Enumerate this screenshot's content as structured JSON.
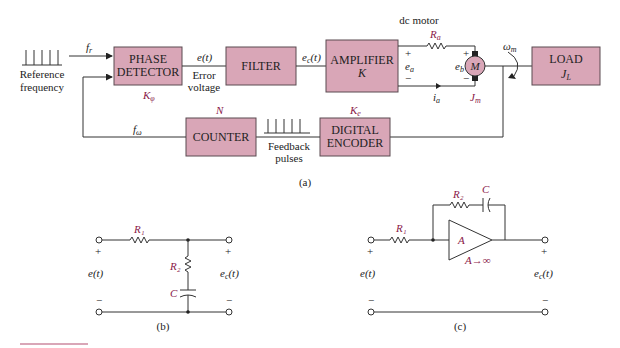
{
  "diagram_a": {
    "caption": "(a)",
    "reference": {
      "label_line1": "Reference",
      "label_line2": "frequency",
      "signal": "f_r"
    },
    "blocks": {
      "phase_detector": {
        "line1": "PHASE",
        "line2": "DETECTOR",
        "gain": "K_φ"
      },
      "filter": {
        "line1": "FILTER"
      },
      "amplifier": {
        "line1": "AMPLIFIER",
        "line2": "K"
      },
      "load": {
        "line1": "LOAD",
        "line2": "J_L"
      },
      "counter": {
        "line1": "COUNTER",
        "gain": "N"
      },
      "digital_encoder": {
        "line1": "DIGITAL",
        "line2": "ENCODER",
        "gain": "K_e"
      }
    },
    "signals": {
      "error": "e(t)",
      "error_label_line1": "Error",
      "error_label_line2": "voltage",
      "filter_out": "e_c(t)",
      "armature_voltage": "e_a",
      "back_emf": "e_b",
      "armature_current": "i_a",
      "motor_speed": "ω_m",
      "feedback_freq": "f_ω",
      "feedback_label_line1": "Feedback",
      "feedback_label_line2": "pulses"
    },
    "motor": {
      "title": "dc motor",
      "symbol": "M",
      "resistance": "R_a",
      "inertia": "J_m",
      "plus": "+",
      "minus": "−"
    }
  },
  "diagram_b": {
    "caption": "(b)",
    "R1": "R₁",
    "R2": "R₂",
    "C": "C",
    "input": "e(t)",
    "output": "e_c(t)",
    "plus": "+",
    "minus": "−"
  },
  "diagram_c": {
    "caption": "(c)",
    "R1": "R₁",
    "R2": "R₂",
    "C": "C",
    "amp": "A",
    "amp_note": "A→∞",
    "input": "e(t)",
    "output": "e_c(t)",
    "plus": "+",
    "minus": "−"
  },
  "colors": {
    "block_fill": "#d9a6b7",
    "symbol_accent": "#8a2048"
  }
}
